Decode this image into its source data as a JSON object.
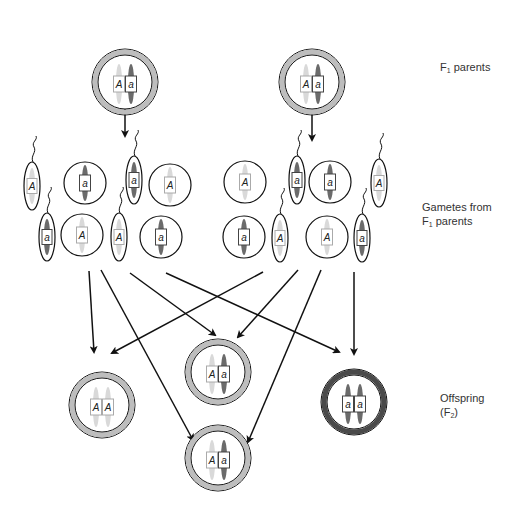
{
  "labels": {
    "f1_parents": {
      "main": "F",
      "sub": "1",
      "rest": " parents"
    },
    "gametes": {
      "line1": "Gametes from",
      "line2_main": "F",
      "line2_sub": "1",
      "line2_rest": " parents"
    },
    "offspring": {
      "line1": "Offspring",
      "line2_open": "(F",
      "line2_sub": "2",
      "line2_close": ")"
    }
  },
  "colors": {
    "dominant_chromosome": "#d9d9d9",
    "recessive_chromosome": "#6b6b6b",
    "hetero_ring": "#bdbdbd",
    "recessive_ring": "#4a4a4a",
    "outline": "#111111"
  },
  "parents": [
    {
      "id": "parent-left",
      "cx": 125,
      "cy": 82,
      "genotype": [
        "A",
        "a"
      ]
    },
    {
      "id": "parent-right",
      "cx": 312,
      "cy": 82,
      "genotype": [
        "A",
        "a"
      ]
    }
  ],
  "gametes": [
    {
      "type": "sperm",
      "allele": "A",
      "cx": 32,
      "cy": 186
    },
    {
      "type": "egg",
      "allele": "a",
      "cx": 85,
      "cy": 183
    },
    {
      "type": "sperm",
      "allele": "a",
      "cx": 134,
      "cy": 180
    },
    {
      "type": "egg",
      "allele": "A",
      "cx": 170,
      "cy": 185
    },
    {
      "type": "sperm",
      "allele": "a",
      "cx": 47,
      "cy": 237
    },
    {
      "type": "egg",
      "allele": "A",
      "cx": 82,
      "cy": 235
    },
    {
      "type": "sperm",
      "allele": "A",
      "cx": 119,
      "cy": 237
    },
    {
      "type": "egg",
      "allele": "a",
      "cx": 161,
      "cy": 237
    },
    {
      "type": "egg",
      "allele": "A",
      "cx": 245,
      "cy": 182
    },
    {
      "type": "sperm",
      "allele": "a",
      "cx": 297,
      "cy": 180
    },
    {
      "type": "egg",
      "allele": "a",
      "cx": 330,
      "cy": 182
    },
    {
      "type": "sperm",
      "allele": "A",
      "cx": 379,
      "cy": 183
    },
    {
      "type": "egg",
      "allele": "a",
      "cx": 244,
      "cy": 237
    },
    {
      "type": "sperm",
      "allele": "A",
      "cx": 280,
      "cy": 238
    },
    {
      "type": "egg",
      "allele": "A",
      "cx": 327,
      "cy": 237
    },
    {
      "type": "sperm",
      "allele": "a",
      "cx": 362,
      "cy": 238
    }
  ],
  "offspring": [
    {
      "id": "offspring-AA",
      "cx": 102,
      "cy": 405,
      "genotype": [
        "A",
        "A"
      ],
      "ring": "hetero"
    },
    {
      "id": "offspring-Aa-top",
      "cx": 218,
      "cy": 372,
      "genotype": [
        "A",
        "a"
      ],
      "ring": "hetero"
    },
    {
      "id": "offspring-aa",
      "cx": 354,
      "cy": 402,
      "genotype": [
        "a",
        "a"
      ],
      "ring": "recessive"
    },
    {
      "id": "offspring-Aa-bottom",
      "cx": 218,
      "cy": 458,
      "genotype": [
        "A",
        "a"
      ],
      "ring": "hetero"
    }
  ],
  "arrows": [
    {
      "x1": 125,
      "y1": 107,
      "x2": 125,
      "y2": 136
    },
    {
      "x1": 312,
      "y1": 112,
      "x2": 312,
      "y2": 140
    },
    {
      "x1": 89,
      "y1": 271,
      "x2": 94,
      "y2": 352
    },
    {
      "x1": 101,
      "y1": 270,
      "x2": 193,
      "y2": 440
    },
    {
      "x1": 130,
      "y1": 273,
      "x2": 215,
      "y2": 335
    },
    {
      "x1": 166,
      "y1": 273,
      "x2": 339,
      "y2": 352
    },
    {
      "x1": 263,
      "y1": 272,
      "x2": 112,
      "y2": 353
    },
    {
      "x1": 298,
      "y1": 270,
      "x2": 238,
      "y2": 337
    },
    {
      "x1": 321,
      "y1": 270,
      "x2": 248,
      "y2": 442
    },
    {
      "x1": 354,
      "y1": 272,
      "x2": 354,
      "y2": 354
    }
  ]
}
